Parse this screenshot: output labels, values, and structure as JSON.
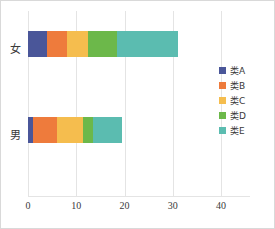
{
  "chart_data": {
    "type": "bar",
    "orientation": "horizontal",
    "stacked": true,
    "title": "",
    "xlabel": "",
    "ylabel": "",
    "categories": [
      "女",
      "男"
    ],
    "xlim": [
      0,
      46
    ],
    "xticks": [
      0,
      10,
      20,
      30,
      40
    ],
    "xtick_labels": [
      "0",
      "10",
      "20",
      "30",
      "40"
    ],
    "grid": "vertical",
    "legend_position": "right",
    "series": [
      {
        "name": "类A",
        "color": "#4a5699",
        "values": [
          4.0,
          1.0
        ]
      },
      {
        "name": "类B",
        "color": "#ee7b3c",
        "values": [
          4.0,
          5.0
        ]
      },
      {
        "name": "类C",
        "color": "#f5bd4e",
        "values": [
          4.5,
          5.5
        ]
      },
      {
        "name": "类D",
        "color": "#6cb84a",
        "values": [
          6.0,
          2.0
        ]
      },
      {
        "name": "类E",
        "color": "#5bbcb0",
        "values": [
          12.5,
          6.0
        ]
      }
    ],
    "totals": [
      31.0,
      19.5
    ]
  },
  "axis": {
    "tick_0": "0",
    "tick_1": "10",
    "tick_2": "20",
    "tick_3": "30",
    "tick_4": "40"
  },
  "categories": {
    "female": "女",
    "male": "男"
  },
  "legend": {
    "item_0": "类A",
    "item_1": "类B",
    "item_2": "类C",
    "item_3": "类D",
    "item_4": "类E"
  },
  "colors": {
    "type_a": "#4a5699",
    "type_b": "#ee7b3c",
    "type_c": "#f5bd4e",
    "type_d": "#6cb84a",
    "type_e": "#5bbcb0",
    "gridline": "#e4e4e4",
    "frame": "#d9d9d9",
    "text": "#3a3a3a"
  }
}
